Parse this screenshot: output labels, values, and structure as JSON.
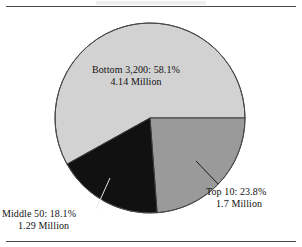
{
  "figure": {
    "name": "pie-chart-figure",
    "has_top_rule": true,
    "has_bottom_rule": true
  },
  "chart_data": {
    "type": "pie",
    "title": "",
    "subtitle": "",
    "xlabel": "",
    "ylabel": "",
    "legend_position": "none",
    "grid": false,
    "units": "Million",
    "total_value": 7.13,
    "categories": [
      "Top 10",
      "Middle 50",
      "Bottom 3,200"
    ],
    "values": [
      23.8,
      18.1,
      58.1
    ],
    "value_unit": "percent",
    "absolute_values": [
      1.7,
      1.29,
      4.14
    ],
    "colors": [
      "#9a9a9a",
      "#111111",
      "#d2d2d2"
    ],
    "start_angle_deg": 0,
    "direction": "clockwise",
    "slices": [
      {
        "name": "Top 10",
        "percent": 23.8,
        "percent_text": "23.8%",
        "label_line1": "Top 10:  23.8%",
        "label_line2": "1.7 Million",
        "absolute": 1.7,
        "absolute_text": "1.7 Million",
        "color": "#9a9a9a",
        "start_deg": 0,
        "end_deg": 85.7,
        "label_placement": "outside-right",
        "has_leader_line": true
      },
      {
        "name": "Middle 50",
        "percent": 18.1,
        "percent_text": "18.1%",
        "label_line1": "Middle 50:  18.1%",
        "label_line2": "1.29 Million",
        "absolute": 1.29,
        "absolute_text": "1.29 Million",
        "color": "#111111",
        "start_deg": 85.7,
        "end_deg": 150.9,
        "label_placement": "outside-bottom-left",
        "has_leader_line": true
      },
      {
        "name": "Bottom 3,200",
        "percent": 58.1,
        "percent_text": "58.1%",
        "label_line1": "Bottom 3,200:  58.1%",
        "label_line2": "4.14 Million",
        "absolute": 4.14,
        "absolute_text": "4.14 Million",
        "color": "#d2d2d2",
        "start_deg": 150.9,
        "end_deg": 360,
        "label_placement": "inside",
        "has_leader_line": false
      }
    ]
  },
  "labels": {
    "bottom": {
      "line1": "Bottom 3,200:  58.1%",
      "line2": "4.14 Million"
    },
    "top10": {
      "line1": "Top 10:  23.8%",
      "line2": "1.7 Million"
    },
    "middle50": {
      "line1": "Middle 50:  18.1%",
      "line2": "1.29 Million"
    }
  }
}
